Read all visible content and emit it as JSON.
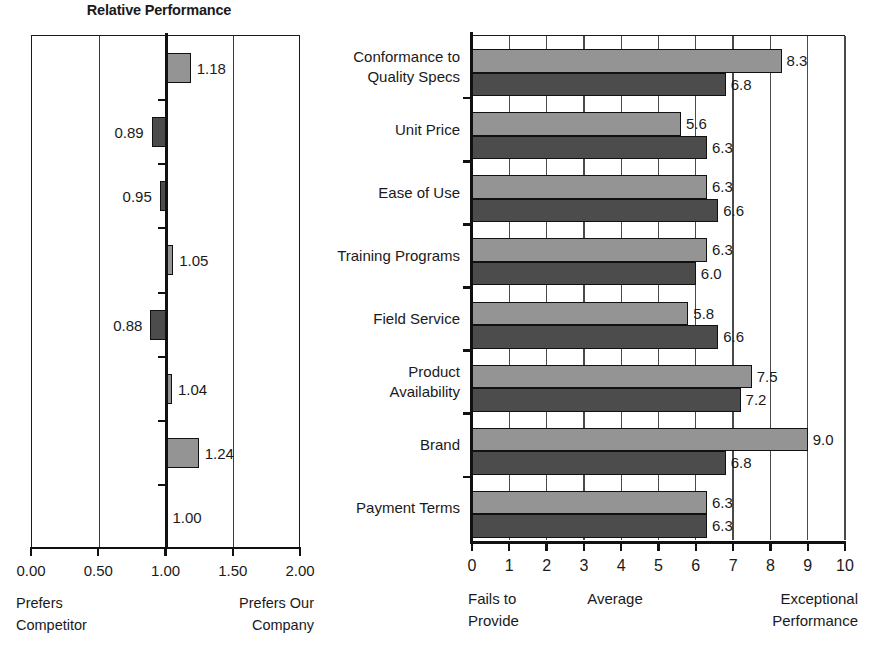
{
  "chart_data": [
    {
      "id": "relative-performance",
      "type": "bar",
      "orientation": "horizontal",
      "title": "Relative Performance",
      "xlabel": "",
      "ylabel": "",
      "baseline": 1.0,
      "xlim": [
        0.0,
        2.0
      ],
      "grid": true,
      "tick_labels": [
        "0.00",
        "0.50",
        "1.00",
        "1.50",
        "2.00"
      ],
      "tick_values": [
        0.0,
        0.5,
        1.0,
        1.5,
        2.0
      ],
      "axis_note_left": "Prefers Competitor",
      "axis_note_left_lines": [
        "Prefers",
        "Competitor"
      ],
      "axis_note_right": "Prefers Our Company",
      "axis_note_right_lines": [
        "Prefers Our",
        "Company"
      ],
      "categories": [
        "Conformance to Quality Specs",
        "Unit Price",
        "Ease of Use",
        "Training Programs",
        "Field Service",
        "Product Availability",
        "Brand",
        "Payment Terms"
      ],
      "values": [
        1.18,
        0.89,
        0.95,
        1.05,
        0.88,
        1.04,
        1.24,
        1.0
      ],
      "labels": [
        "1.18",
        "0.89",
        "0.95",
        "1.05",
        "0.88",
        "1.04",
        "1.24",
        "1.00"
      ],
      "colors": {
        "above_baseline": "#949494",
        "below_baseline": "#4c4c4c"
      }
    },
    {
      "id": "performance-ratings",
      "type": "bar",
      "orientation": "horizontal",
      "title": "",
      "xlabel": "",
      "ylabel": "",
      "xlim": [
        0,
        10
      ],
      "grid": true,
      "tick_labels": [
        "0",
        "1",
        "2",
        "3",
        "4",
        "5",
        "6",
        "7",
        "8",
        "9",
        "10"
      ],
      "tick_values": [
        0,
        1,
        2,
        3,
        4,
        5,
        6,
        7,
        8,
        9,
        10
      ],
      "axis_note_left": "Fails to Provide",
      "axis_note_left_lines": [
        "Fails to",
        "Provide"
      ],
      "axis_note_mid": "Average",
      "axis_note_right": "Exceptional Performance",
      "axis_note_right_lines": [
        "Exceptional",
        "Performance"
      ],
      "categories": [
        "Conformance to Quality Specs",
        "Unit Price",
        "Ease of Use",
        "Training Programs",
        "Field Service",
        "Product Availability",
        "Brand",
        "Payment Terms"
      ],
      "category_lines": [
        [
          "Conformance to",
          "Quality Specs"
        ],
        [
          "Unit Price"
        ],
        [
          "Ease of Use"
        ],
        [
          "Training Programs"
        ],
        [
          "Field Service"
        ],
        [
          "Product",
          "Availability"
        ],
        [
          "Brand"
        ],
        [
          "Payment Terms"
        ]
      ],
      "series": [
        {
          "name": "light",
          "color": "#949494",
          "values": [
            8.3,
            5.6,
            6.3,
            6.3,
            5.8,
            7.5,
            9.0,
            6.3
          ],
          "labels": [
            "8.3",
            "5.6",
            "6.3",
            "6.3",
            "5.8",
            "7.5",
            "9.0",
            "6.3"
          ]
        },
        {
          "name": "dark",
          "color": "#4c4c4c",
          "values": [
            6.8,
            6.3,
            6.6,
            6.0,
            6.6,
            7.2,
            6.8,
            6.3
          ],
          "labels": [
            "6.8",
            "6.3",
            "6.6",
            "6.0",
            "6.6",
            "7.2",
            "6.8",
            "6.3"
          ]
        }
      ]
    }
  ]
}
